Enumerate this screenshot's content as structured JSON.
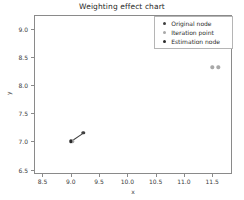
{
  "chart_data": {
    "type": "scatter",
    "title": "Weighting effect chart",
    "xlabel": "x",
    "ylabel": "y",
    "xlim": [
      8.35,
      11.85
    ],
    "ylim": [
      6.42,
      9.25
    ],
    "xticks": [
      "8.5",
      "9.0",
      "9.5",
      "10.0",
      "10.5",
      "11.0",
      "11.5"
    ],
    "xtick_values": [
      8.5,
      9.0,
      9.5,
      10.0,
      10.5,
      11.0,
      11.5
    ],
    "yticks": [
      "6.5",
      "7.0",
      "7.5",
      "8.0",
      "8.5",
      "9.0"
    ],
    "ytick_values": [
      6.5,
      7.0,
      7.5,
      8.0,
      8.5,
      9.0
    ],
    "grid": false,
    "legend_position": "upper right",
    "series": [
      {
        "name": "Original node",
        "color": "#3f3f3f",
        "marker": "o",
        "points": [
          {
            "x": 9.22,
            "y": 7.15
          }
        ]
      },
      {
        "name": "Iteration point",
        "color": "#a8a8a8",
        "marker": "o",
        "points": [
          {
            "x": 11.5,
            "y": 8.32
          },
          {
            "x": 11.61,
            "y": 8.32
          },
          {
            "x": 9.03,
            "y": 7.0
          }
        ]
      },
      {
        "name": "Estimation node",
        "color": "#2b2b2b",
        "marker": "o",
        "points": [
          {
            "x": 9.0,
            "y": 7.0
          }
        ]
      }
    ],
    "connector": {
      "x1": 9.0,
      "y1": 7.0,
      "x2": 9.22,
      "y2": 7.15,
      "color": "#3f3f3f"
    }
  },
  "legend": {
    "items": [
      {
        "label": "Original node"
      },
      {
        "label": "Iteration point"
      },
      {
        "label": "Estimation node"
      }
    ]
  }
}
